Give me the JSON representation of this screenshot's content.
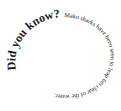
{
  "spiral_text": {
    "headline": "Did you know?",
    "body": "Mako sharks have been seen to leap 6m clear of the water."
  },
  "colors": {
    "text": "#1a1a1a",
    "background": "#ffffff"
  }
}
